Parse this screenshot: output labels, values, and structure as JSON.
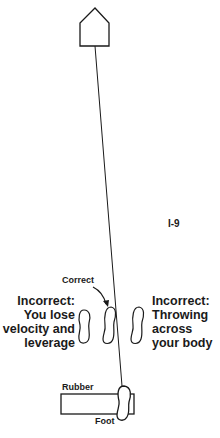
{
  "figure": {
    "id_label": "I-9",
    "home_plate": "home-plate",
    "labels": {
      "correct": "Correct",
      "rubber": "Rubber",
      "foot": "Foot"
    },
    "incorrect_left": {
      "lines": [
        "Incorrect:",
        "You lose",
        "velocity and",
        "leverage"
      ]
    },
    "incorrect_right": {
      "lines": [
        "Incorrect:",
        "Throwing",
        "across",
        "your body"
      ]
    },
    "colors": {
      "stroke": "#1a1a1a",
      "background": "#ffffff"
    }
  }
}
